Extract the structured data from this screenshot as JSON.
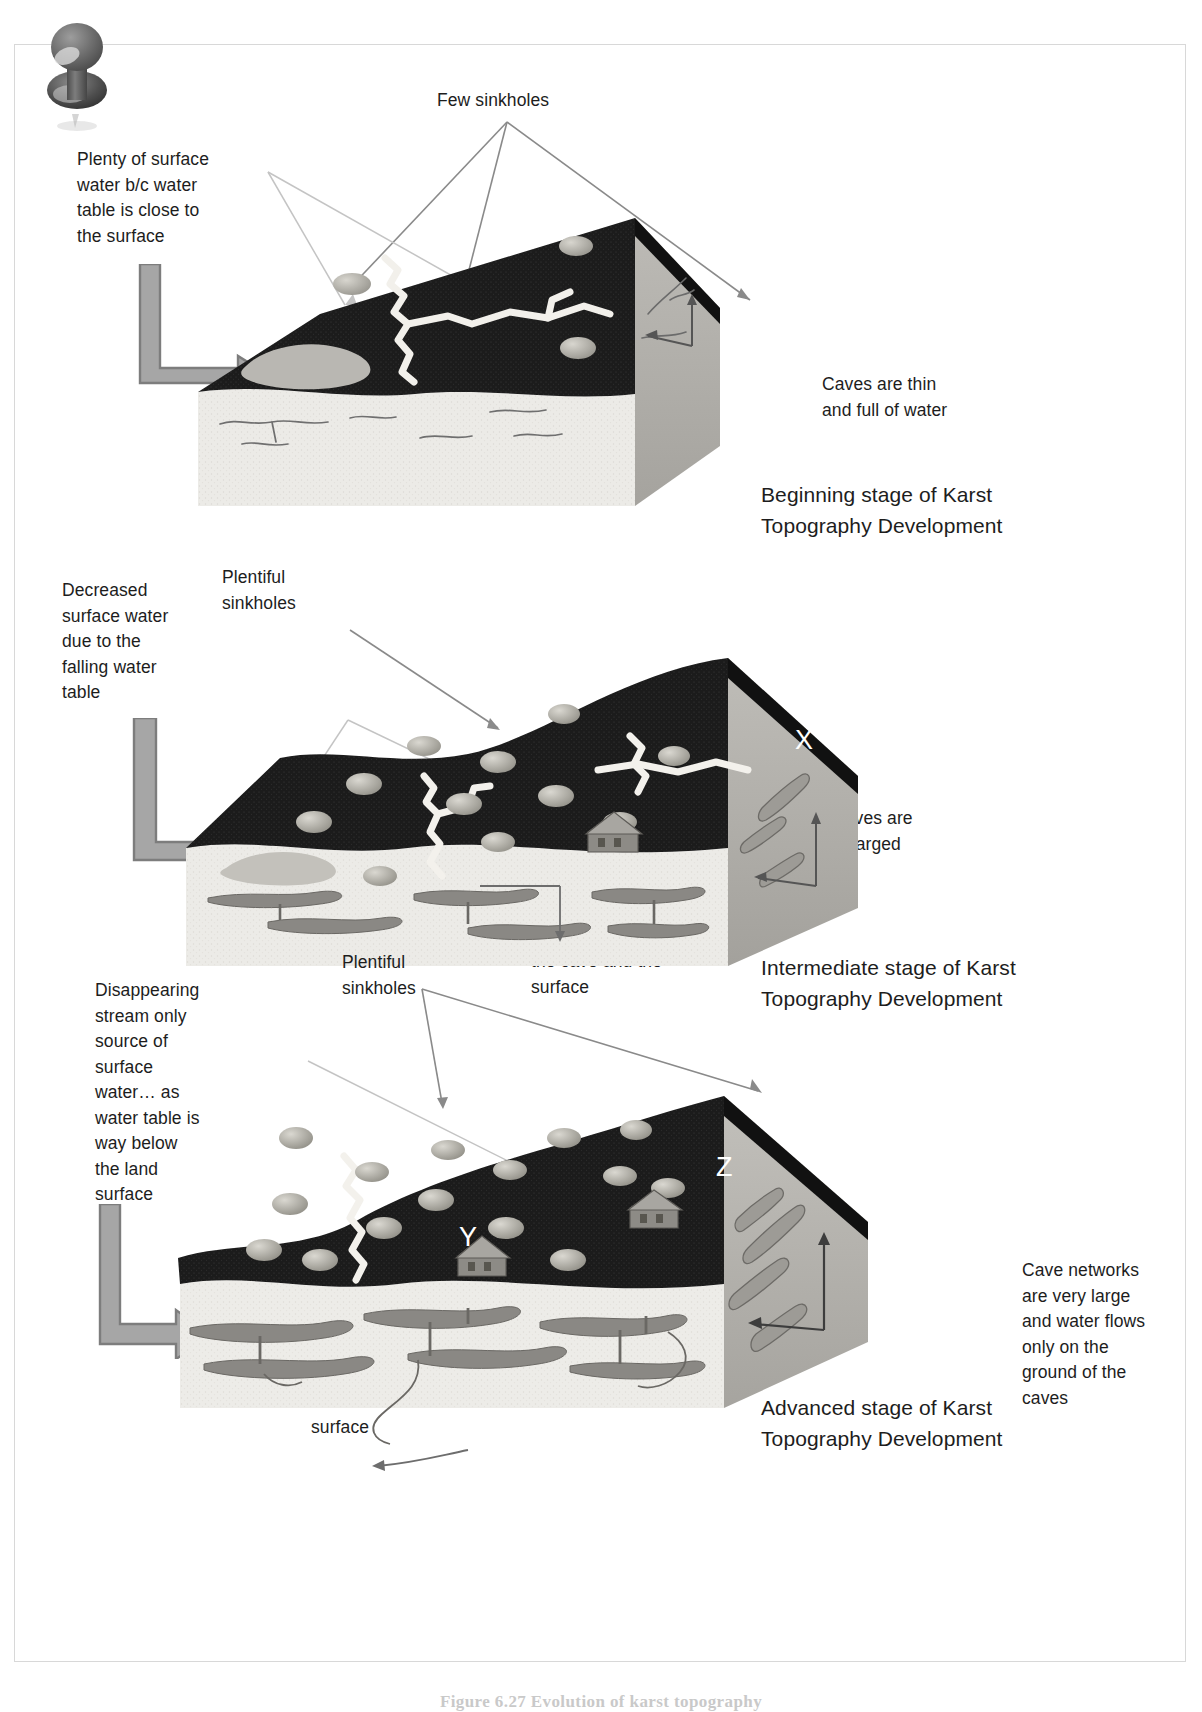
{
  "figure": {
    "pushpin_icon": "pushpin-icon",
    "caption": "Figure 6.27   Evolution of karst topography"
  },
  "panels": [
    {
      "id": "beginning",
      "stage_title": "Beginning stage of Karst\nTopography Development",
      "labels": [
        {
          "name": "few-sinkholes-label",
          "text": "Few sinkholes"
        },
        {
          "name": "surface-water-label",
          "text": "Plenty of surface\nwater b/c water\ntable is close to\nthe surface"
        },
        {
          "name": "caves-thin-label",
          "text": "Caves are thin\nand full of water"
        }
      ],
      "in_block_letters": []
    },
    {
      "id": "intermediate",
      "stage_title": "Intermediate stage of Karst\nTopography Development",
      "labels": [
        {
          "name": "decreased-surface-water-label",
          "text": "Decreased\nsurface water\ndue to the\nfalling water\ntable"
        },
        {
          "name": "plentiful-sinkholes-label",
          "text": "Plentiful\nsinkholes"
        },
        {
          "name": "caves-enlarged-label",
          "text": "Caves are\nenlarged"
        },
        {
          "name": "thin-roof-space-label",
          "text": "Thin “roof\nspace” between\nthe cave and the\nsurface"
        }
      ],
      "in_block_letters": [
        {
          "name": "marker-x",
          "text": "X"
        }
      ]
    },
    {
      "id": "advanced",
      "stage_title": "Advanced stage of Karst\nTopography Development",
      "labels": [
        {
          "name": "disappearing-stream-label",
          "text": "Disappearing\nstream only\nsource of\nsurface\nwater… as\nwater table is\nway below\nthe land\nsurface"
        },
        {
          "name": "plentiful-sinkholes-label",
          "text": "Plentiful\nsinkholes"
        },
        {
          "name": "cave-networks-label",
          "text": "Cave networks\nare very large\nand water flows\nonly on the\nground of the\ncaves"
        },
        {
          "name": "thin-roof-space-label",
          "text": "Thin “roof\nspace” between\nthe cave and the\nsurface"
        }
      ],
      "in_block_letters": [
        {
          "name": "marker-y",
          "text": "Y"
        },
        {
          "name": "marker-z",
          "text": "Z"
        }
      ]
    }
  ],
  "colors": {
    "soil_dark": "#1c1c1c",
    "limestone_light": "#ebeae6",
    "limestone_side": "#b3b1ac",
    "water_gray": "#b9b7b2",
    "arrow_gray": "#8f8f8f",
    "text": "#1d1d1d",
    "frame_border": "#d8d8d8",
    "caption_gray": "#c9c9c9"
  }
}
